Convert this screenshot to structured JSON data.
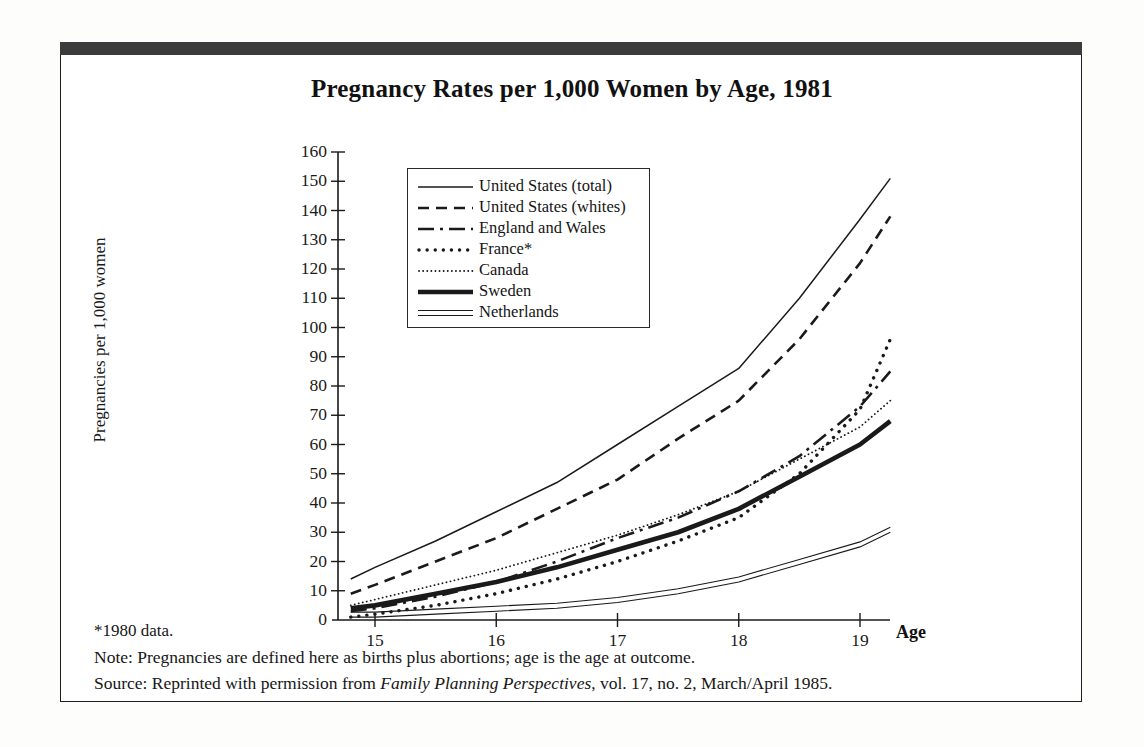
{
  "figure": {
    "title": "Pregnancy Rates per 1,000 Women by Age, 1981",
    "axis_x_title": "Age",
    "axis_y_title": "Pregnancies per 1,000 women",
    "frame_color": "#3b3b3b"
  },
  "notes": {
    "asterisk": "*1980 data.",
    "note_label": "Note:",
    "note_text": "Pregnancies are defined here as births plus abortions; age is the age at outcome.",
    "source_label": "Source:",
    "source_prefix": "Reprinted with permission from ",
    "source_italic": "Family Planning Perspectives",
    "source_suffix": ", vol. 17, no. 2, March/April 1985."
  },
  "legend": {
    "items": [
      {
        "label": "United States (total)",
        "style": "solid-thin"
      },
      {
        "label": "United States (whites)",
        "style": "dashed"
      },
      {
        "label": "England and Wales",
        "style": "dash-dot-dash"
      },
      {
        "label": "France*",
        "style": "dotted-coarse"
      },
      {
        "label": "Canada",
        "style": "dotted-fine"
      },
      {
        "label": "Sweden",
        "style": "solid-thick"
      },
      {
        "label": "Netherlands",
        "style": "double-line"
      }
    ]
  },
  "chart_data": {
    "type": "line",
    "title": "Pregnancy Rates per 1,000 Women by Age, 1981",
    "xlabel": "Age",
    "ylabel": "Pregnancies per 1,000 women",
    "xlim": [
      14.8,
      19.25
    ],
    "ylim": [
      0,
      160
    ],
    "xticks": [
      15,
      16,
      17,
      18,
      19
    ],
    "yticks": [
      0,
      10,
      20,
      30,
      40,
      50,
      60,
      70,
      80,
      90,
      100,
      110,
      120,
      130,
      140,
      150,
      160
    ],
    "grid": false,
    "legend_position": "upper-left-inside",
    "x": [
      14.8,
      15,
      15.5,
      16,
      16.5,
      17,
      17.5,
      18,
      18.5,
      19,
      19.25
    ],
    "series": [
      {
        "name": "United States (total)",
        "values": [
          14,
          18,
          27,
          37,
          47,
          60,
          73,
          86,
          110,
          137,
          151
        ]
      },
      {
        "name": "United States (whites)",
        "values": [
          9,
          12,
          20,
          28,
          38,
          48,
          62,
          75,
          96,
          122,
          138
        ]
      },
      {
        "name": "England and Wales",
        "values": [
          3,
          4,
          8,
          13,
          20,
          28,
          35,
          44,
          56,
          73,
          85
        ]
      },
      {
        "name": "France*",
        "values": [
          1,
          2,
          5,
          9,
          14,
          20,
          27,
          35,
          50,
          72,
          96
        ]
      },
      {
        "name": "Canada",
        "values": [
          5,
          7,
          12,
          17,
          23,
          29,
          36,
          44,
          55,
          66,
          75
        ]
      },
      {
        "name": "Sweden",
        "values": [
          4,
          5,
          9,
          13,
          18,
          24,
          30,
          38,
          49,
          60,
          68
        ]
      },
      {
        "name": "Netherlands",
        "values": [
          1,
          1,
          2,
          3,
          4,
          6,
          9,
          13,
          19,
          25,
          30
        ]
      }
    ],
    "values_at_ticks": {
      "United States (total)": {
        "15": 18,
        "16": 37,
        "17": 60,
        "18": 86,
        "19": 137
      },
      "United States (whites)": {
        "15": 12,
        "16": 28,
        "17": 48,
        "18": 75,
        "19": 122
      },
      "England and Wales": {
        "15": 4,
        "16": 13,
        "17": 28,
        "18": 44,
        "19": 73
      },
      "France*": {
        "15": 2,
        "16": 9,
        "17": 20,
        "18": 35,
        "19": 72
      },
      "Canada": {
        "15": 7,
        "16": 17,
        "17": 29,
        "18": 44,
        "19": 66
      },
      "Sweden": {
        "15": 5,
        "16": 13,
        "17": 24,
        "18": 38,
        "19": 60
      },
      "Netherlands": {
        "15": 1,
        "16": 3,
        "17": 6,
        "18": 13,
        "19": 25
      }
    }
  }
}
